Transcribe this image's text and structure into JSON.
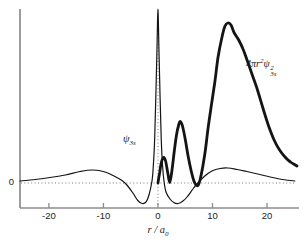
{
  "figure": {
    "background": "#ffffff",
    "axis_color": "#8c8c8c",
    "curve_color": "#141414",
    "dotted_color": "#7a7a7a",
    "text_color": "#1a1a1a"
  },
  "labels": {
    "psi": {
      "symbol": "ψ",
      "sub": "3s"
    },
    "rdf": {
      "coef": "4",
      "pi": "π",
      "var": "r",
      "var_sup": "2",
      "psi": "ψ",
      "psi_sup": "2",
      "psi_sub": "3s"
    },
    "xaxis": {
      "var": "r",
      "sep": " / ",
      "denom": "a",
      "denom_sub": "0"
    },
    "y_zero": "0"
  },
  "chart_data": {
    "type": "line",
    "title": "",
    "xlabel": "r / a0",
    "ylabel": "",
    "xlim": [
      -25.3,
      25.5
    ],
    "ylim": [
      -0.25,
      1.74
    ],
    "x_ticks": [
      -20,
      -10,
      0,
      10,
      20
    ],
    "x_tick_labels": [
      "-20",
      "-10",
      "0",
      "10",
      "20"
    ],
    "y_zero_label": "0",
    "grid": "off",
    "zero_line_style": "dotted-horizontal",
    "center_line_style": "dotted-vertical-at-x0",
    "legend_position": "inline-annotations",
    "series": [
      {
        "name": "psi_3s",
        "label": "ψ3s",
        "weight": "thin",
        "points": [
          [
            -25.3,
            0.02
          ],
          [
            -22.5,
            0.035
          ],
          [
            -19.8,
            0.055
          ],
          [
            -17.0,
            0.08
          ],
          [
            -14.3,
            0.115
          ],
          [
            -11.9,
            0.13
          ],
          [
            -9.7,
            0.11
          ],
          [
            -7.9,
            0.065
          ],
          [
            -6.6,
            0.025
          ],
          [
            -5.7,
            -0.02
          ],
          [
            -4.6,
            -0.1
          ],
          [
            -3.7,
            -0.175
          ],
          [
            -2.9,
            -0.205
          ],
          [
            -2.2,
            -0.19
          ],
          [
            -1.65,
            -0.12
          ],
          [
            -1.1,
            0.02
          ],
          [
            -0.85,
            0.17
          ],
          [
            -0.6,
            0.45
          ],
          [
            -0.4,
            0.85
          ],
          [
            -0.2,
            1.3
          ],
          [
            -0.08,
            1.6
          ],
          [
            0,
            1.74
          ],
          [
            0.08,
            1.6
          ],
          [
            0.2,
            1.3
          ],
          [
            0.4,
            0.85
          ],
          [
            0.6,
            0.45
          ],
          [
            0.85,
            0.17
          ],
          [
            1.1,
            0.02
          ],
          [
            1.47,
            -0.09
          ],
          [
            2.2,
            -0.16
          ],
          [
            2.9,
            -0.195
          ],
          [
            3.7,
            -0.205
          ],
          [
            4.6,
            -0.18
          ],
          [
            5.5,
            -0.13
          ],
          [
            6.4,
            -0.06
          ],
          [
            7.3,
            0.0
          ],
          [
            8.6,
            0.07
          ],
          [
            9.9,
            0.12
          ],
          [
            11.4,
            0.145
          ],
          [
            12.8,
            0.15
          ],
          [
            14.5,
            0.135
          ],
          [
            16.3,
            0.115
          ],
          [
            18.3,
            0.09
          ],
          [
            20.6,
            0.06
          ],
          [
            22.8,
            0.035
          ],
          [
            25.1,
            0.02
          ]
        ]
      },
      {
        "name": "radial_distribution_3s",
        "label": "4πr²ψ²3s",
        "weight": "thick",
        "points": [
          [
            0,
            0
          ],
          [
            0.3,
            0.1
          ],
          [
            0.6,
            0.2
          ],
          [
            1.0,
            0.255
          ],
          [
            1.4,
            0.22
          ],
          [
            1.8,
            0.1
          ],
          [
            2.15,
            0.005
          ],
          [
            2.5,
            0.1
          ],
          [
            3.0,
            0.32
          ],
          [
            3.4,
            0.48
          ],
          [
            3.8,
            0.58
          ],
          [
            4.1,
            0.615
          ],
          [
            4.5,
            0.57
          ],
          [
            5.0,
            0.44
          ],
          [
            5.5,
            0.28
          ],
          [
            6.1,
            0.12
          ],
          [
            6.6,
            0.02
          ],
          [
            7.0,
            -0.02
          ],
          [
            7.4,
            -0.02
          ],
          [
            7.8,
            0.05
          ],
          [
            8.2,
            0.16
          ],
          [
            8.7,
            0.33
          ],
          [
            9.2,
            0.55
          ],
          [
            9.8,
            0.78
          ],
          [
            10.4,
            1.0
          ],
          [
            11.0,
            1.25
          ],
          [
            11.7,
            1.45
          ],
          [
            12.3,
            1.57
          ],
          [
            12.8,
            1.6
          ],
          [
            13.4,
            1.58
          ],
          [
            14.0,
            1.5
          ],
          [
            14.8,
            1.43
          ],
          [
            15.6,
            1.34
          ],
          [
            16.4,
            1.22
          ],
          [
            17.3,
            1.08
          ],
          [
            18.2,
            0.94
          ],
          [
            19.3,
            0.74
          ],
          [
            20.3,
            0.57
          ],
          [
            21.3,
            0.43
          ],
          [
            22.3,
            0.33
          ],
          [
            23.3,
            0.26
          ],
          [
            24.3,
            0.21
          ],
          [
            25.2,
            0.18
          ],
          [
            25.5,
            0.17
          ]
        ]
      }
    ]
  }
}
